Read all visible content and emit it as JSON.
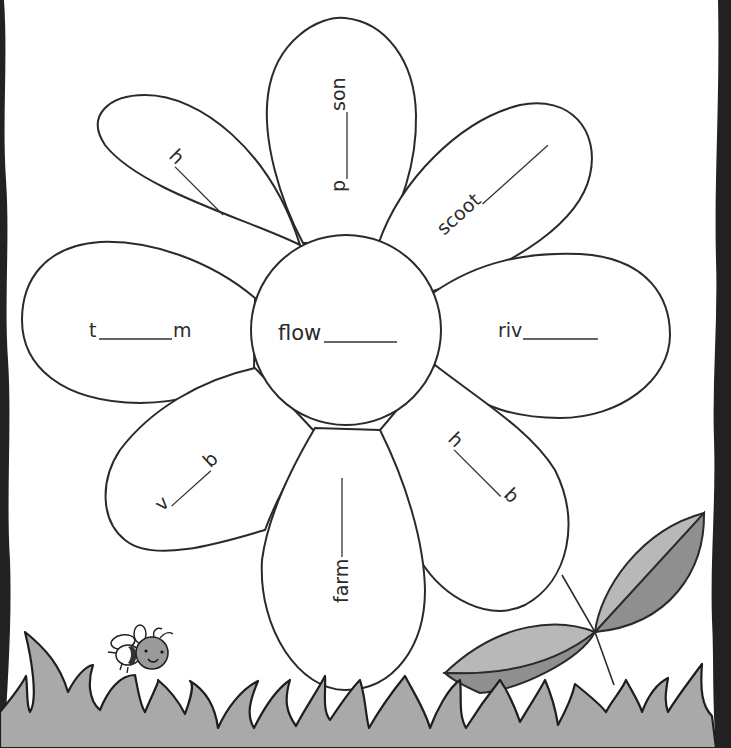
{
  "worksheet": {
    "center": {
      "prefix": "flow",
      "suffix": ""
    },
    "petals": [
      {
        "id": "top",
        "prefix": "p",
        "suffix": "son"
      },
      {
        "id": "top-right",
        "prefix": "scoot",
        "suffix": ""
      },
      {
        "id": "right",
        "prefix": "riv",
        "suffix": ""
      },
      {
        "id": "bottom-right",
        "prefix": "h",
        "suffix": "b"
      },
      {
        "id": "bottom",
        "prefix": "farm",
        "suffix": ""
      },
      {
        "id": "bottom-left",
        "prefix": "v",
        "suffix": "b"
      },
      {
        "id": "left",
        "prefix": "t",
        "suffix": "m"
      },
      {
        "id": "top-left",
        "prefix": "h",
        "suffix": ""
      }
    ]
  },
  "decorations": {
    "bee": "bee-illustration",
    "leaves": "leaf-pair-illustration",
    "grass": "grass-strip"
  },
  "colors": {
    "outline": "#2a2a2a",
    "grass": "#a9a9a9",
    "leaf_light": "#b8b8b8",
    "leaf_dark": "#8f8f8f",
    "border": "#222222",
    "paper": "#ffffff"
  }
}
